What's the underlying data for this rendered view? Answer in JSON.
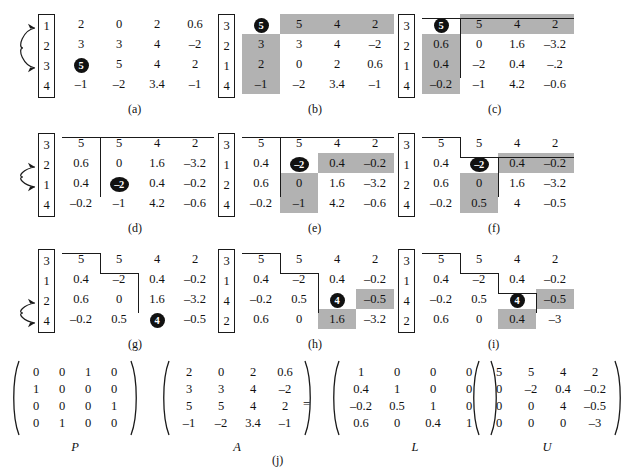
{
  "figure": {
    "caption_j": "(j)",
    "shade_color": "#b2b2b2",
    "pivot_color": "#111111"
  },
  "panels": [
    {
      "id": "a",
      "caption": "(a)",
      "perm": [
        "1",
        "2",
        "3",
        "4"
      ],
      "swap": {
        "from_row": 1,
        "to_row": 3
      },
      "rows": [
        [
          "2",
          "0",
          "2",
          "0.6"
        ],
        [
          "3",
          "3",
          "4",
          "–2"
        ],
        [
          "5",
          "5",
          "4",
          "2"
        ],
        [
          "–1",
          "–2",
          "3.4",
          "–1"
        ]
      ],
      "pivot": {
        "row": 3,
        "col": 1,
        "value": "5"
      },
      "shaded": [],
      "lines": []
    },
    {
      "id": "b",
      "caption": "(b)",
      "perm": [
        "3",
        "2",
        "1",
        "4"
      ],
      "swap": null,
      "rows": [
        [
          "5",
          "5",
          "4",
          "2"
        ],
        [
          "3",
          "3",
          "4",
          "–2"
        ],
        [
          "2",
          "0",
          "2",
          "0.6"
        ],
        [
          "–1",
          "–2",
          "3.4",
          "–1"
        ]
      ],
      "pivot": {
        "row": 1,
        "col": 1,
        "value": "5"
      },
      "shaded": [
        [
          1,
          2
        ],
        [
          1,
          3
        ],
        [
          1,
          4
        ],
        [
          2,
          1
        ],
        [
          3,
          1
        ],
        [
          4,
          1
        ]
      ],
      "lines": []
    },
    {
      "id": "c",
      "caption": "(c)",
      "perm": [
        "3",
        "2",
        "1",
        "4"
      ],
      "swap": null,
      "rows": [
        [
          "5",
          "5",
          "4",
          "2"
        ],
        [
          "0.6",
          "0",
          "1.6",
          "–3.2"
        ],
        [
          "0.4",
          "–2",
          "0.4",
          "–.2"
        ],
        [
          "–0.2",
          "–1",
          "4.2",
          "–0.6"
        ]
      ],
      "pivot": {
        "row": 1,
        "col": 1,
        "value": "5"
      },
      "shaded": [
        [
          1,
          2
        ],
        [
          1,
          3
        ],
        [
          1,
          4
        ],
        [
          2,
          1
        ],
        [
          3,
          1
        ],
        [
          4,
          1
        ]
      ],
      "lines": [
        "step1"
      ]
    },
    {
      "id": "d",
      "caption": "(d)",
      "perm": [
        "3",
        "2",
        "1",
        "4"
      ],
      "swap": {
        "from_row": 2,
        "to_row": 3
      },
      "rows": [
        [
          "5",
          "5",
          "4",
          "2"
        ],
        [
          "0.6",
          "0",
          "1.6",
          "–3.2"
        ],
        [
          "0.4",
          "–2",
          "0.4",
          "–0.2"
        ],
        [
          "–0.2",
          "–1",
          "4.2",
          "–0.6"
        ]
      ],
      "pivot": {
        "row": 3,
        "col": 2,
        "value": "–2"
      },
      "shaded": [],
      "lines": [
        "step1"
      ]
    },
    {
      "id": "e",
      "caption": "(e)",
      "perm": [
        "3",
        "1",
        "2",
        "4"
      ],
      "swap": null,
      "rows": [
        [
          "5",
          "5",
          "4",
          "2"
        ],
        [
          "0.4",
          "–2",
          "0.4",
          "–0.2"
        ],
        [
          "0.6",
          "0",
          "1.6",
          "–3.2"
        ],
        [
          "–0.2",
          "–1",
          "4.2",
          "–0.6"
        ]
      ],
      "pivot": {
        "row": 2,
        "col": 2,
        "value": "–2"
      },
      "shaded": [
        [
          2,
          3
        ],
        [
          2,
          4
        ],
        [
          3,
          2
        ],
        [
          4,
          2
        ]
      ],
      "lines": [
        "step1"
      ]
    },
    {
      "id": "f",
      "caption": "(f)",
      "perm": [
        "3",
        "1",
        "2",
        "4"
      ],
      "swap": null,
      "rows": [
        [
          "5",
          "5",
          "4",
          "2"
        ],
        [
          "0.4",
          "–2",
          "0.4",
          "–0.2"
        ],
        [
          "0.6",
          "0",
          "1.6",
          "–3.2"
        ],
        [
          "–0.2",
          "0.5",
          "4",
          "–0.5"
        ]
      ],
      "pivot": {
        "row": 2,
        "col": 2,
        "value": "–2"
      },
      "shaded": [
        [
          2,
          3
        ],
        [
          2,
          4
        ],
        [
          3,
          2
        ],
        [
          4,
          2
        ]
      ],
      "lines": [
        "step2"
      ]
    },
    {
      "id": "g",
      "caption": "(g)",
      "perm": [
        "3",
        "1",
        "2",
        "4"
      ],
      "swap": {
        "from_row": 3,
        "to_row": 4
      },
      "rows": [
        [
          "5",
          "5",
          "4",
          "2"
        ],
        [
          "0.4",
          "–2",
          "0.4",
          "–0.2"
        ],
        [
          "0.6",
          "0",
          "1.6",
          "–3.2"
        ],
        [
          "–0.2",
          "0.5",
          "4",
          "–0.5"
        ]
      ],
      "pivot": {
        "row": 4,
        "col": 3,
        "value": "4"
      },
      "shaded": [],
      "lines": [
        "step3"
      ]
    },
    {
      "id": "h",
      "caption": "(h)",
      "perm": [
        "3",
        "1",
        "4",
        "2"
      ],
      "swap": null,
      "rows": [
        [
          "5",
          "5",
          "4",
          "2"
        ],
        [
          "0.4",
          "–2",
          "0.4",
          "–0.2"
        ],
        [
          "–0.2",
          "0.5",
          "4",
          "–0.5"
        ],
        [
          "0.6",
          "0",
          "1.6",
          "–3.2"
        ]
      ],
      "pivot": {
        "row": 3,
        "col": 3,
        "value": "4"
      },
      "shaded": [
        [
          3,
          4
        ],
        [
          4,
          3
        ]
      ],
      "lines": [
        "step3"
      ]
    },
    {
      "id": "i",
      "caption": "(i)",
      "perm": [
        "3",
        "1",
        "4",
        "2"
      ],
      "swap": null,
      "rows": [
        [
          "5",
          "5",
          "4",
          "2"
        ],
        [
          "0.4",
          "–2",
          "0.4",
          "–0.2"
        ],
        [
          "–0.2",
          "0.5",
          "4",
          "–0.5"
        ],
        [
          "0.6",
          "0",
          "0.4",
          "–3"
        ]
      ],
      "pivot": {
        "row": 3,
        "col": 3,
        "value": "4"
      },
      "shaded": [
        [
          3,
          4
        ],
        [
          4,
          3
        ]
      ],
      "lines": [
        "step4"
      ]
    }
  ],
  "equation": {
    "eq_sign": "=",
    "matrices": [
      {
        "label": "P",
        "rows": [
          [
            "0",
            "0",
            "1",
            "0"
          ],
          [
            "1",
            "0",
            "0",
            "0"
          ],
          [
            "0",
            "0",
            "0",
            "1"
          ],
          [
            "0",
            "1",
            "0",
            "0"
          ]
        ]
      },
      {
        "label": "A",
        "rows": [
          [
            "2",
            "0",
            "2",
            "0.6"
          ],
          [
            "3",
            "3",
            "4",
            "–2"
          ],
          [
            "5",
            "5",
            "4",
            "2"
          ],
          [
            "–1",
            "–2",
            "3.4",
            "–1"
          ]
        ]
      },
      {
        "label": "L",
        "rows": [
          [
            "1",
            "0",
            "0",
            "0"
          ],
          [
            "0.4",
            "1",
            "0",
            "0"
          ],
          [
            "–0.2",
            "0.5",
            "1",
            "0"
          ],
          [
            "0.6",
            "0",
            "0.4",
            "1"
          ]
        ]
      },
      {
        "label": "U",
        "rows": [
          [
            "5",
            "5",
            "4",
            "2"
          ],
          [
            "0",
            "–2",
            "0.4",
            "–0.2"
          ],
          [
            "0",
            "0",
            "4",
            "–0.5"
          ],
          [
            "0",
            "0",
            "0",
            "–3"
          ]
        ]
      }
    ]
  }
}
